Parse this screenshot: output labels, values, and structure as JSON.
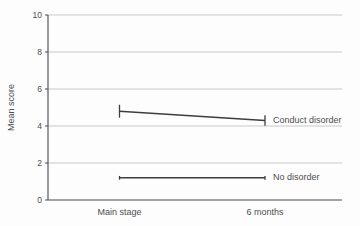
{
  "chart_data": {
    "type": "line",
    "title": "",
    "ylabel": "Mean score",
    "xlabel": "",
    "categories": [
      "Main stage",
      "6 months"
    ],
    "ylim": [
      0,
      10
    ],
    "yticks": [
      0,
      2,
      4,
      6,
      8,
      10
    ],
    "grid": "horizontal-light",
    "legend_position": "labels-right-of-line-ends",
    "series": [
      {
        "name": "Conduct disorder",
        "values": [
          4.8,
          4.3
        ],
        "error_bars": [
          0.35,
          0.28
        ]
      },
      {
        "name": "No disorder",
        "values": [
          1.2,
          1.2
        ],
        "error_bars": [
          0.1,
          0.1
        ]
      }
    ]
  },
  "colors": {
    "background": "#fdfdfd",
    "axis": "#4a4a4a",
    "gridline": "#c9c9c9",
    "line": "#3d3d3d",
    "text": "#4d4d4d"
  }
}
